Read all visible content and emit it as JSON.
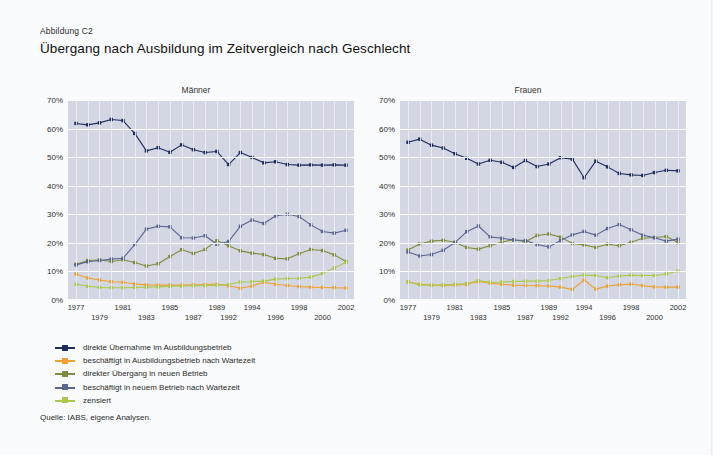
{
  "figure": {
    "label": "Abbildung C2",
    "title": "Übergang nach Ausbildung im Zeitvergleich nach Geschlecht",
    "source": "Quelle: IABS, eigene Analysen."
  },
  "legend": [
    {
      "key": "direkte_uebernahme",
      "label": "direkte Übernahme im Ausbildungsbetrieb",
      "color": "#1f2d5c"
    },
    {
      "key": "beschaeftigt_ausbildung_warte",
      "label": "beschäftigt in Ausbildungsbetrieb nach Wartezeit",
      "color": "#f0a030"
    },
    {
      "key": "direkter_uebergang_neu",
      "label": "direkter Übergang in neuen Betrieb",
      "color": "#7d8c3c"
    },
    {
      "key": "beschaeftigt_neu_warte",
      "label": "beschäftigt in neuem Betrieb nach Wartezeit",
      "color": "#5a6590"
    },
    {
      "key": "zensiert",
      "label": "zensiert",
      "color": "#aac84a"
    }
  ],
  "chart_data": [
    {
      "type": "line",
      "title": "Männer",
      "xlabel": "",
      "ylabel": "",
      "ylim": [
        0,
        70
      ],
      "yticks": [
        0,
        10,
        20,
        30,
        40,
        50,
        60,
        70
      ],
      "ytick_labels": [
        "0%",
        "10%",
        "20%",
        "30%",
        "40%",
        "50%",
        "60%",
        "70%"
      ],
      "grid": true,
      "legend_position": "below",
      "categories": [
        1977,
        1978,
        1979,
        1980,
        1981,
        1982,
        1983,
        1984,
        1985,
        1986,
        1987,
        1988,
        1989,
        1992,
        1993,
        1994,
        1995,
        1996,
        1997,
        1998,
        1999,
        2000,
        2001,
        2002
      ],
      "xtick_labels_row0": [
        "1977",
        "1981",
        "1985",
        "1989",
        "1994",
        "1998",
        "2002"
      ],
      "xtick_labels_row1": [
        "1979",
        "1983",
        "1987",
        "1992",
        "1996",
        "2000"
      ],
      "series": [
        {
          "name": "direkte Übernahme im Ausbildungsbetrieb",
          "color": "#1f2d5c",
          "values": [
            61.8,
            61.3,
            62.0,
            63.2,
            62.8,
            58.3,
            52.2,
            53.3,
            51.7,
            54.3,
            52.6,
            51.6,
            52.0,
            47.4,
            51.6,
            49.9,
            48.0,
            48.4,
            47.4,
            47.2,
            47.3,
            47.2,
            47.3,
            47.2
          ]
        },
        {
          "name": "beschäftigt in Ausbildungsbetrieb nach Wartezeit",
          "color": "#f0a030",
          "values": [
            9.1,
            7.7,
            7.0,
            6.4,
            6.2,
            5.6,
            5.3,
            5.2,
            5.2,
            5.2,
            5.3,
            5.4,
            5.5,
            5.0,
            4.1,
            4.9,
            6.2,
            5.5,
            5.1,
            4.7,
            4.5,
            4.4,
            4.3,
            4.2
          ]
        },
        {
          "name": "direkter Übergang in neuen Betrieb",
          "color": "#7d8c3c",
          "values": [
            12.5,
            13.8,
            14.0,
            13.5,
            14.1,
            13.1,
            11.9,
            12.7,
            15.2,
            17.6,
            16.3,
            17.7,
            20.8,
            19.0,
            17.2,
            16.4,
            15.9,
            14.6,
            14.4,
            16.2,
            17.7,
            17.3,
            15.8,
            13.5
          ]
        },
        {
          "name": "beschäftigt in neuem Betrieb nach Wartezeit",
          "color": "#5a6590",
          "values": [
            12.3,
            13.4,
            13.8,
            14.3,
            14.6,
            19.4,
            24.8,
            25.8,
            25.6,
            21.8,
            21.7,
            22.5,
            19.5,
            20.5,
            25.8,
            28.0,
            26.8,
            29.4,
            30.0,
            29.2,
            26.3,
            24.0,
            23.4,
            24.4
          ]
        },
        {
          "name": "zensiert",
          "color": "#aac84a",
          "values": [
            5.5,
            4.8,
            4.4,
            4.3,
            4.3,
            4.4,
            4.5,
            4.6,
            4.8,
            4.9,
            5.0,
            5.0,
            5.2,
            5.4,
            6.3,
            6.4,
            6.6,
            7.3,
            7.5,
            7.6,
            8.0,
            9.3,
            11.2,
            13.2
          ]
        }
      ]
    },
    {
      "type": "line",
      "title": "Frauen",
      "xlabel": "",
      "ylabel": "",
      "ylim": [
        0,
        70
      ],
      "yticks": [
        0,
        10,
        20,
        30,
        40,
        50,
        60,
        70
      ],
      "ytick_labels": [
        "0%",
        "10%",
        "20%",
        "30%",
        "40%",
        "50%",
        "60%",
        "70%"
      ],
      "grid": true,
      "legend_position": "below",
      "categories": [
        1977,
        1978,
        1979,
        1980,
        1981,
        1982,
        1983,
        1984,
        1985,
        1986,
        1987,
        1988,
        1989,
        1992,
        1993,
        1994,
        1995,
        1996,
        1997,
        1998,
        1999,
        2000,
        2001,
        2002
      ],
      "xtick_labels_row0": [
        "1977",
        "1981",
        "1985",
        "1989",
        "1994",
        "1998",
        "2002"
      ],
      "xtick_labels_row1": [
        "1979",
        "1983",
        "1987",
        "1992",
        "1996",
        "2000"
      ],
      "series": [
        {
          "name": "direkte Übernahme im Ausbildungsbetrieb",
          "color": "#1f2d5c",
          "values": [
            55.2,
            56.3,
            54.2,
            53.2,
            51.2,
            49.6,
            47.6,
            48.9,
            48.2,
            46.4,
            48.8,
            46.7,
            47.6,
            49.8,
            49.3,
            42.8,
            48.6,
            46.6,
            44.3,
            43.8,
            43.6,
            44.6,
            45.4,
            45.2
          ]
        },
        {
          "name": "beschäftigt in Ausbildungsbetrieb nach Wartezeit",
          "color": "#f0a030",
          "values": [
            6.4,
            5.5,
            5.2,
            5.1,
            5.3,
            5.4,
            6.5,
            5.9,
            5.5,
            5.2,
            5.1,
            5.0,
            4.9,
            4.5,
            3.7,
            7.0,
            3.8,
            4.9,
            5.3,
            5.6,
            5.0,
            4.6,
            4.5,
            4.5
          ]
        },
        {
          "name": "direkter Übergang in neuen Betrieb",
          "color": "#7d8c3c",
          "values": [
            17.5,
            19.6,
            20.6,
            20.9,
            20.2,
            18.4,
            17.8,
            19.0,
            20.3,
            21.1,
            20.4,
            22.6,
            23.1,
            22.0,
            19.8,
            19.3,
            18.4,
            19.5,
            19.0,
            20.2,
            21.6,
            21.9,
            22.2,
            20.1
          ]
        },
        {
          "name": "beschäftigt in neuem Betrieb nach Wartezeit",
          "color": "#5a6590",
          "values": [
            16.8,
            15.4,
            15.9,
            17.4,
            20.1,
            23.9,
            25.9,
            22.1,
            21.6,
            21.0,
            20.8,
            19.4,
            18.6,
            20.8,
            22.8,
            24.0,
            22.7,
            25.0,
            26.4,
            24.6,
            22.7,
            21.8,
            20.6,
            21.3
          ]
        },
        {
          "name": "zensiert",
          "color": "#aac84a",
          "values": [
            6.3,
            5.3,
            5.2,
            5.3,
            5.5,
            5.8,
            6.8,
            6.2,
            6.3,
            6.5,
            6.6,
            6.6,
            6.8,
            7.5,
            8.2,
            8.7,
            8.6,
            7.8,
            8.4,
            8.7,
            8.6,
            8.6,
            9.1,
            10.2
          ]
        }
      ]
    }
  ]
}
